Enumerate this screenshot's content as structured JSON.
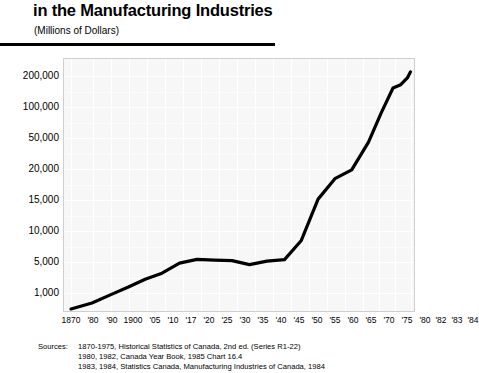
{
  "header": {
    "title": "in the Manufacturing Industries",
    "subtitle": "(Millions of Dollars)"
  },
  "sources": {
    "label": "Sources:",
    "lines": [
      "1870-1975, Historical Statistics of Canada, 2nd ed. (Series R1-22)",
      "1980, 1982, Canada Year Book, 1985 Chart 16.4",
      "1983, 1984, Statistics Canada, Manufacturing Industries of Canada, 1984"
    ]
  },
  "chart_data": {
    "type": "line",
    "title": "in the Manufacturing Industries",
    "subtitle": "(Millions of Dollars)",
    "xlabel": "",
    "ylabel": "",
    "grid": true,
    "legend": null,
    "line_color": "#000000",
    "plot_background": "#f7f7f7",
    "y_scale": "custom-compressed",
    "y_ticks": [
      "1,000",
      "5,000",
      "10,000",
      "15,000",
      "20,000",
      "50,000",
      "100,000",
      "200,000"
    ],
    "y_tick_values": [
      1000,
      5000,
      10000,
      15000,
      20000,
      50000,
      100000,
      200000
    ],
    "y_tick_positions_pct": [
      92.5,
      80.3,
      68.5,
      56.3,
      44.1,
      31.9,
      19.7,
      7.5
    ],
    "categories": [
      "1870",
      "'80",
      "'90",
      "1900",
      "'05",
      "'10",
      "'17",
      "'20",
      "'25",
      "'30",
      "'35",
      "'40",
      "'45",
      "'50",
      "'55",
      "'60",
      "'65",
      "'70",
      "'75",
      "'80",
      "'82",
      "'83",
      "'84"
    ],
    "values": [
      221,
      310,
      470,
      715,
      1000,
      1165,
      2950,
      3300,
      3100,
      3100,
      2700,
      3100,
      3200,
      4000,
      9000,
      19500,
      21000,
      40000,
      85000,
      190000,
      195000,
      205000,
      225000
    ],
    "x_positions_pct": [
      2.0,
      8.0,
      13.4,
      18.4,
      23.2,
      28.0,
      33.0,
      38.0,
      43.0,
      48.0,
      53.0,
      58.0,
      63.0,
      67.8,
      72.6,
      77.4,
      82.2,
      87.0,
      90.6,
      94.0,
      96.2,
      98.1,
      99.0
    ],
    "y_positions_pct": [
      99.2,
      96.8,
      93.5,
      90.5,
      87.4,
      85.0,
      81.0,
      79.5,
      79.8,
      80.0,
      81.6,
      80.2,
      79.6,
      72.0,
      55.6,
      47.5,
      44.0,
      33.0,
      21.5,
      11.5,
      10.2,
      7.5,
      5.1
    ]
  },
  "y_axis": {
    "ticks": [
      {
        "label": "200,000",
        "top": 13
      },
      {
        "label": "100,000",
        "top": 44
      },
      {
        "label": "50,000",
        "top": 75
      },
      {
        "label": "20,000",
        "top": 106
      },
      {
        "label": "15,000",
        "top": 137
      },
      {
        "label": "10,000",
        "top": 168
      },
      {
        "label": "5,000",
        "top": 199
      },
      {
        "label": "1,000",
        "top": 230
      }
    ]
  },
  "x_axis": {
    "ticks": [
      {
        "label": "1870",
        "left": 8
      },
      {
        "label": "'80",
        "left": 30
      },
      {
        "label": "'90",
        "left": 49
      },
      {
        "label": "1900",
        "left": 70
      },
      {
        "label": "'05",
        "left": 92
      },
      {
        "label": "'10",
        "left": 110
      },
      {
        "label": "'17",
        "left": 128
      },
      {
        "label": "'20",
        "left": 146
      },
      {
        "label": "'25",
        "left": 164
      },
      {
        "label": "'30",
        "left": 182
      },
      {
        "label": "'35",
        "left": 200
      },
      {
        "label": "'40",
        "left": 218
      },
      {
        "label": "'45",
        "left": 236
      },
      {
        "label": "'50",
        "left": 254
      },
      {
        "label": "'55",
        "left": 272
      },
      {
        "label": "'60",
        "left": 290
      },
      {
        "label": "'65",
        "left": 308
      },
      {
        "label": "'70",
        "left": 326
      },
      {
        "label": "'75",
        "left": 344
      },
      {
        "label": "'80",
        "left": 362
      },
      {
        "label": "'82",
        "left": 378
      },
      {
        "label": "'83",
        "left": 394
      },
      {
        "label": "'84",
        "left": 410
      }
    ]
  }
}
